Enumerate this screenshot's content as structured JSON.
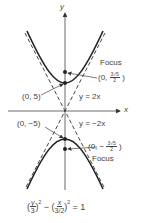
{
  "diagram": {
    "axes": {
      "x_label": "x",
      "y_label": "y"
    },
    "upper": {
      "focus_label": "Focus",
      "focus_coord_prefix": "(0,",
      "focus_num": "3√5",
      "focus_den": "2",
      "focus_coord_suffix": ")",
      "vertex_label": "(0, 5)",
      "asymptote_label": "y = 2x"
    },
    "lower": {
      "focus_label": "Focus",
      "focus_coord_prefix": "(0, −",
      "focus_num": "3√5",
      "focus_den": "2",
      "focus_coord_suffix": ")",
      "vertex_label": "(0, −5)",
      "asymptote_label": "y = −2x"
    },
    "equation": {
      "open1": "(",
      "num1": "y",
      "den1": "3",
      "close1": ")",
      "exp1": "2",
      "minus": " − (",
      "num2": "x",
      "den2": "3/2",
      "close2": ")",
      "exp2": "2",
      "rhs": " = 1"
    }
  }
}
